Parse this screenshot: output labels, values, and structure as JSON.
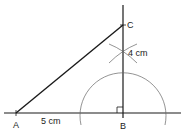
{
  "diagram": {
    "points": {
      "A": {
        "label": "A",
        "x": 16,
        "y": 113
      },
      "B": {
        "label": "B",
        "x": 123,
        "y": 113
      },
      "C": {
        "label": "C",
        "x": 123,
        "y": 25
      }
    },
    "measurements": {
      "AB": "5 cm",
      "BC": "4 cm"
    },
    "colors": {
      "line": "#1a1a1a",
      "arc": "#555555",
      "text": "#222222"
    }
  }
}
